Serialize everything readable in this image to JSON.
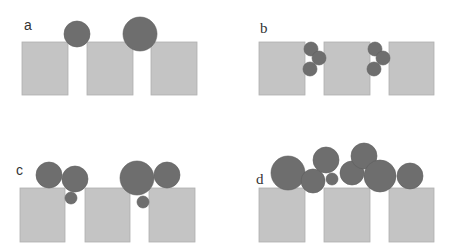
{
  "figure": {
    "colors": {
      "block": "#c4c4c4",
      "block_stroke": "#b0b0b0",
      "particle": "#6e6e6e",
      "label": "#333333"
    },
    "panels": [
      {
        "id": "a",
        "label": "a",
        "label_pos": [
          24,
          30
        ],
        "blocks": [
          {
            "x": 22,
            "y": 42,
            "w": 46,
            "h": 53
          },
          {
            "x": 87,
            "y": 42,
            "w": 46,
            "h": 53
          },
          {
            "x": 151,
            "y": 42,
            "w": 46,
            "h": 53
          }
        ],
        "particles": [
          {
            "cx": 77,
            "cy": 34,
            "r": 13
          },
          {
            "cx": 140,
            "cy": 34,
            "r": 17
          }
        ]
      },
      {
        "id": "b",
        "label": "b",
        "label_pos": [
          260,
          33
        ],
        "blocks": [
          {
            "x": 259,
            "y": 42,
            "w": 46,
            "h": 53
          },
          {
            "x": 324,
            "y": 42,
            "w": 46,
            "h": 53
          },
          {
            "x": 389,
            "y": 42,
            "w": 45,
            "h": 53
          }
        ],
        "particles": [
          {
            "cx": 311,
            "cy": 49,
            "r": 7
          },
          {
            "cx": 319,
            "cy": 58,
            "r": 7
          },
          {
            "cx": 310,
            "cy": 69,
            "r": 7
          },
          {
            "cx": 375,
            "cy": 49,
            "r": 7
          },
          {
            "cx": 383,
            "cy": 58,
            "r": 7
          },
          {
            "cx": 374,
            "cy": 69,
            "r": 7
          }
        ]
      },
      {
        "id": "c",
        "label": "c",
        "label_pos": [
          16,
          175
        ],
        "blocks": [
          {
            "x": 20,
            "y": 188,
            "w": 45,
            "h": 54
          },
          {
            "x": 85,
            "y": 188,
            "w": 45,
            "h": 54
          },
          {
            "x": 149,
            "y": 188,
            "w": 46,
            "h": 54
          }
        ],
        "particles": [
          {
            "cx": 49,
            "cy": 175,
            "r": 13
          },
          {
            "cx": 75,
            "cy": 179,
            "r": 13
          },
          {
            "cx": 71,
            "cy": 198,
            "r": 6
          },
          {
            "cx": 137,
            "cy": 178,
            "r": 17
          },
          {
            "cx": 167,
            "cy": 175,
            "r": 13
          },
          {
            "cx": 143,
            "cy": 202,
            "r": 6
          }
        ]
      },
      {
        "id": "d",
        "label": "d",
        "label_pos": [
          256,
          184
        ],
        "blocks": [
          {
            "x": 259,
            "y": 188,
            "w": 46,
            "h": 54
          },
          {
            "x": 324,
            "y": 188,
            "w": 46,
            "h": 54
          },
          {
            "x": 389,
            "y": 188,
            "w": 45,
            "h": 54
          }
        ],
        "particles": [
          {
            "cx": 288,
            "cy": 173,
            "r": 17
          },
          {
            "cx": 313,
            "cy": 181,
            "r": 12
          },
          {
            "cx": 326,
            "cy": 160,
            "r": 13
          },
          {
            "cx": 332,
            "cy": 179,
            "r": 6
          },
          {
            "cx": 352,
            "cy": 173,
            "r": 12
          },
          {
            "cx": 364,
            "cy": 156,
            "r": 13
          },
          {
            "cx": 380,
            "cy": 176,
            "r": 16
          },
          {
            "cx": 410,
            "cy": 176,
            "r": 13
          }
        ]
      }
    ]
  }
}
